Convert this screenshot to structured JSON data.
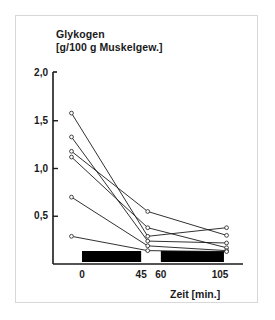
{
  "figure": {
    "title_line1": "Glykogen",
    "title_line2": "[g/100 g Muskelgew.]",
    "xaxis_title": "Zeit [min.]",
    "frame_color": "#d8d8d8",
    "axis_color": "#1a1a1a",
    "line_color": "#1a1a1a",
    "marker_fill": "#ffffff",
    "bar_color": "#000000",
    "background": "#ffffff"
  },
  "chart_data": {
    "type": "line",
    "title": "Glykogen [g/100 g Muskelgew.]",
    "xlabel": "Zeit [min.]",
    "ylabel": "Glykogen [g/100 g Muskelgew.]",
    "xlim": [
      -14,
      118
    ],
    "ylim": [
      0,
      2.0
    ],
    "grid": false,
    "legend": false,
    "yticks": [
      0.5,
      1.0,
      1.5,
      2.0
    ],
    "ytick_labels": [
      "0,5",
      "1,0",
      "1,5",
      "2,0"
    ],
    "xticks": [
      0,
      45,
      60,
      105
    ],
    "xtick_labels": [
      "0",
      "45",
      "60",
      "105"
    ],
    "x": [
      -8,
      50,
      110
    ],
    "series": [
      {
        "name": "subject-1",
        "values": [
          1.58,
          0.29,
          0.38
        ]
      },
      {
        "name": "subject-2",
        "values": [
          1.33,
          0.24,
          0.22
        ]
      },
      {
        "name": "subject-3",
        "values": [
          1.18,
          0.55,
          0.3
        ]
      },
      {
        "name": "subject-4",
        "values": [
          1.12,
          0.38,
          0.17
        ]
      },
      {
        "name": "subject-5",
        "values": [
          0.7,
          0.19,
          0.14
        ]
      },
      {
        "name": "subject-6",
        "values": [
          0.29,
          0.14,
          0.13
        ]
      }
    ],
    "annotations": [
      {
        "name": "exercise-bar-1",
        "x_start": 0,
        "x_end": 45,
        "label": ""
      },
      {
        "name": "exercise-bar-2",
        "x_start": 60,
        "x_end": 108,
        "label": ""
      }
    ]
  }
}
